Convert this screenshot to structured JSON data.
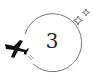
{
  "badge": {
    "number": "3",
    "icons": [
      "airplane-icon",
      "sparkle-icon"
    ],
    "stroke_color": "#555555",
    "plane_color": "#111111"
  }
}
